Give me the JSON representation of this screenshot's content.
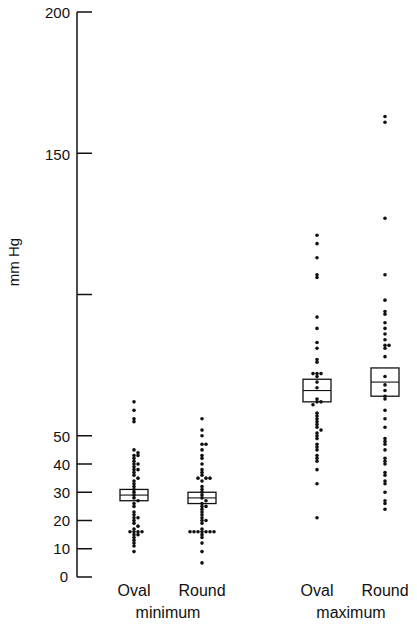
{
  "chart_data": {
    "type": "scatter",
    "subtype": "dot-plot-with-boxes",
    "title": "",
    "ylabel": "mm Hg",
    "xlabel": "",
    "ylim": [
      0,
      200
    ],
    "yticks": [
      0,
      10,
      20,
      30,
      40,
      50,
      100,
      150,
      200
    ],
    "ytick_labels": [
      "0",
      "10",
      "20",
      "30",
      "40",
      "50",
      "",
      "150",
      "200"
    ],
    "grid": false,
    "legend": null,
    "groups": [
      {
        "name": "minimum",
        "categories": [
          {
            "label": "Oval",
            "box": {
              "low": 27,
              "median": 29,
              "high": 31
            },
            "values": [
              62,
              59,
              56,
              55,
              45,
              44,
              43,
              43,
              42,
              41,
              40,
              40,
              39,
              38,
              38,
              37,
              36,
              35,
              34,
              33,
              32,
              31,
              30,
              29,
              28,
              27,
              26,
              25,
              23,
              22,
              21,
              21,
              20,
              19,
              18,
              17,
              16,
              16,
              16,
              16,
              15,
              15,
              14,
              13,
              12,
              11,
              9
            ]
          },
          {
            "label": "Round",
            "box": {
              "low": 26,
              "median": 28,
              "high": 30
            },
            "values": [
              56,
              52,
              50,
              47,
              47,
              45,
              43,
              42,
              40,
              38,
              37,
              36,
              35,
              35,
              35,
              34,
              32,
              31,
              30,
              29,
              28,
              27,
              26,
              25,
              25,
              24,
              23,
              22,
              21,
              20,
              20,
              19,
              17,
              16,
              16,
              16,
              16,
              16,
              16,
              16,
              15,
              14,
              12,
              9,
              5
            ]
          }
        ]
      },
      {
        "name": "maximum",
        "categories": [
          {
            "label": "Oval",
            "box": {
              "low": 62,
              "median": 66,
              "high": 70
            },
            "values": [
              121,
              118,
              113,
              107,
              106,
              92,
              88,
              83,
              81,
              77,
              76,
              72,
              72,
              72,
              71,
              69,
              67,
              63,
              62,
              62,
              61,
              58,
              57,
              56,
              55,
              54,
              53,
              52,
              51,
              50,
              49,
              47,
              46,
              45,
              43,
              42,
              41,
              38,
              33,
              21
            ]
          },
          {
            "label": "Round",
            "box": {
              "low": 64,
              "median": 69,
              "high": 74
            },
            "values": [
              163,
              161,
              127,
              107,
              98,
              94,
              93,
              90,
              88,
              86,
              84,
              82,
              82,
              81,
              78,
              71,
              68,
              66,
              64,
              63,
              59,
              56,
              53,
              49,
              48,
              47,
              45,
              42,
              41,
              40,
              37,
              36,
              34,
              33,
              30,
              27,
              26,
              24
            ]
          }
        ]
      }
    ]
  },
  "axis": {
    "ylabel": "mm Hg",
    "tick_labels": {
      "t0": "0",
      "t10": "10",
      "t20": "20",
      "t30": "30",
      "t40": "40",
      "t50": "50",
      "t150": "150",
      "t200": "200"
    }
  },
  "xaxis": {
    "minimum_oval": "Oval",
    "minimum_round": "Round",
    "maximum_oval": "Oval",
    "maximum_round": "Round",
    "group_minimum": "minimum",
    "group_maximum": "maximum"
  }
}
